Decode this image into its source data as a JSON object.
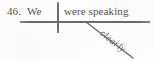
{
  "figure": {
    "type": "reed-kellogg-sentence-diagram",
    "exercise_number": "46.",
    "sentence": "We were speaking clearly",
    "ink_color": "#6d6a68",
    "text_color": "#555150",
    "background_color": "#fefefe"
  },
  "diagram": {
    "subject": {
      "label": "We",
      "role": "subject"
    },
    "predicate": {
      "label": "were speaking",
      "role": "verb-phrase"
    },
    "modifier": {
      "label": "clearly",
      "role": "adverb",
      "modifies": "were speaking",
      "angle_degrees": 38
    },
    "lines": {
      "baseline_name": "horizontal-baseline",
      "divider_name": "subject-predicate-divider",
      "modifier_name": "diagonal-modifier-line"
    }
  }
}
